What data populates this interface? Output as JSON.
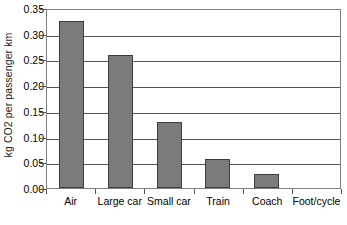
{
  "chart_data": {
    "type": "bar",
    "title": "",
    "subtitle": "",
    "xlabel": "",
    "ylabel": "kg CO2 per passenger km",
    "categories": [
      "Air",
      "Large car",
      "Small car",
      "Train",
      "Coach",
      "Foot/cycle"
    ],
    "values": [
      0.325,
      0.258,
      0.128,
      0.057,
      0.028,
      0
    ],
    "ylim": [
      0,
      0.35
    ],
    "ytick_labels": [
      "0.35",
      "0.30",
      "0.25",
      "0.20",
      "0.15",
      "0.10",
      "0.05",
      "0.00"
    ],
    "ytick_values": [
      0.35,
      0.3,
      0.25,
      0.2,
      0.15,
      0.1,
      0.05,
      0.0
    ],
    "grid": true,
    "legend": false,
    "legend_position": "none",
    "bar_color": "#7b7b7b",
    "bar_border_color": "#3d3d3d",
    "gridline_color": "#555555",
    "frame_color": "#808080",
    "text_color": "#000000"
  }
}
